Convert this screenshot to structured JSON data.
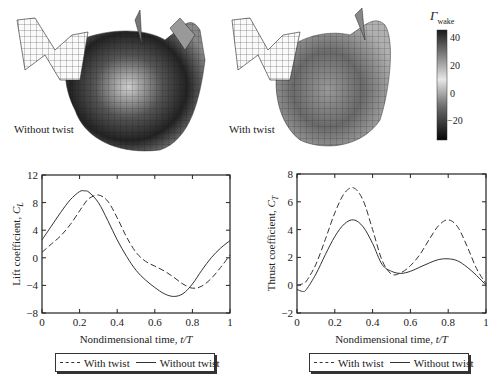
{
  "figure": {
    "wake_panels": [
      {
        "label": "Without twist"
      },
      {
        "label": "With twist"
      }
    ],
    "colorbar": {
      "title_main": "Γ",
      "title_sub": "wake",
      "ticks": [
        "40",
        "20",
        "0",
        "−20"
      ],
      "range": [
        -32,
        46
      ]
    }
  },
  "chart_data": [
    {
      "type": "line",
      "title": "",
      "xlabel": "Nondimensional time, t/T",
      "ylabel": "Lift coefficient, C_L",
      "xlim": [
        0,
        1
      ],
      "ylim": [
        -8,
        12
      ],
      "xticks": [
        "0",
        "0.2",
        "0.4",
        "0.6",
        "0.8",
        "1"
      ],
      "yticks": [
        "12",
        "8",
        "4",
        "0",
        "−4",
        "−8"
      ],
      "grid": false,
      "legend_position": "bottom",
      "x": [
        0,
        0.05,
        0.1,
        0.15,
        0.2,
        0.225,
        0.25,
        0.3,
        0.35,
        0.4,
        0.45,
        0.5,
        0.55,
        0.6,
        0.65,
        0.7,
        0.75,
        0.8,
        0.85,
        0.9,
        0.95,
        1.0
      ],
      "series": [
        {
          "name": "With twist",
          "style": "dashed",
          "values": [
            0.8,
            2.0,
            3.2,
            4.8,
            6.8,
            7.8,
            8.6,
            9.1,
            8.2,
            5.8,
            3.0,
            0.8,
            -0.5,
            -1.2,
            -1.9,
            -2.8,
            -3.8,
            -4.4,
            -4.1,
            -3.0,
            -1.4,
            0.4
          ]
        },
        {
          "name": "Without twist",
          "style": "solid",
          "values": [
            2.6,
            4.6,
            6.6,
            8.4,
            9.6,
            9.7,
            9.5,
            8.0,
            5.4,
            2.6,
            0.2,
            -1.8,
            -3.2,
            -4.3,
            -5.2,
            -5.6,
            -5.2,
            -3.8,
            -1.8,
            0.0,
            1.4,
            2.5
          ]
        }
      ]
    },
    {
      "type": "line",
      "title": "",
      "xlabel": "Nondimensional time, t/T",
      "ylabel": "Thrust coefficient, C_T",
      "xlim": [
        0,
        1
      ],
      "ylim": [
        -2,
        8
      ],
      "xticks": [
        "0",
        "0.2",
        "0.4",
        "0.6",
        "0.8",
        "1"
      ],
      "yticks": [
        "8",
        "6",
        "4",
        "2",
        "0",
        "−2"
      ],
      "grid": false,
      "legend_position": "bottom",
      "x": [
        0,
        0.03,
        0.05,
        0.1,
        0.15,
        0.2,
        0.25,
        0.3,
        0.35,
        0.4,
        0.45,
        0.5,
        0.55,
        0.6,
        0.65,
        0.7,
        0.75,
        0.8,
        0.85,
        0.9,
        0.95,
        1.0
      ],
      "series": [
        {
          "name": "With twist",
          "style": "dashed",
          "values": [
            0.0,
            0.1,
            0.3,
            1.5,
            3.3,
            5.2,
            6.6,
            7.0,
            6.1,
            4.0,
            1.8,
            0.8,
            0.9,
            1.4,
            2.2,
            3.3,
            4.3,
            4.7,
            4.2,
            2.8,
            1.2,
            0.1
          ]
        },
        {
          "name": "Without twist",
          "style": "solid",
          "values": [
            -0.3,
            -0.45,
            -0.3,
            0.8,
            2.2,
            3.5,
            4.4,
            4.7,
            4.2,
            3.0,
            1.5,
            1.0,
            0.85,
            1.0,
            1.3,
            1.6,
            1.85,
            1.9,
            1.75,
            1.3,
            0.7,
            0.0
          ]
        }
      ]
    }
  ]
}
